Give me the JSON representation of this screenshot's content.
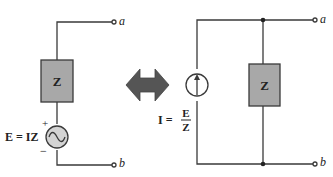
{
  "colors": {
    "wire": "#3a3a3a",
    "impedance_fill": "#a8a8a8",
    "source_fill": "#d4d4d4",
    "arrow_fill": "#555555"
  },
  "left_circuit": {
    "terminal_a": "a",
    "terminal_b": "b",
    "impedance_label": "Z",
    "source_plus": "+",
    "source_minus": "−",
    "source_equation": "E = IZ"
  },
  "equivalence_arrow": "double-arrow",
  "right_circuit": {
    "terminal_a": "a",
    "terminal_b": "b",
    "impedance_label": "Z",
    "source_equation_lhs": "I =",
    "source_equation_num": "E",
    "source_equation_den": "Z"
  }
}
